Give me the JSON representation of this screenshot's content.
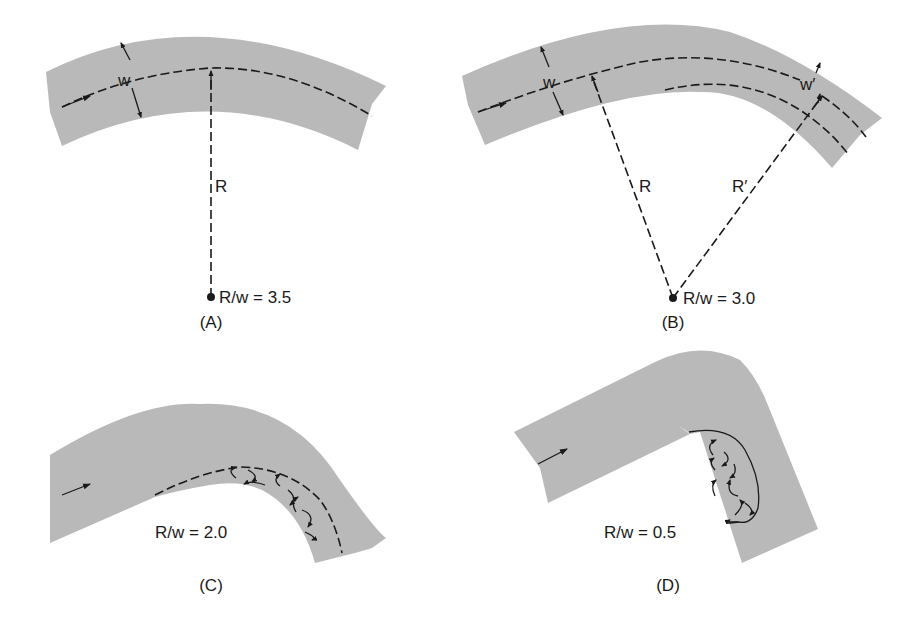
{
  "figure": {
    "panels": [
      {
        "id": "A",
        "caption": "(A)",
        "ratio_label": "R/w = 3.5",
        "radius_label": "R",
        "width_label": "w",
        "description": "Gentle bend, flow follows center streamline"
      },
      {
        "id": "B",
        "caption": "(B)",
        "ratio_label": "R/w = 3.0",
        "radius_label": "R",
        "radius_prime_label": "R′",
        "width_label": "w",
        "width_prime_label": "w′",
        "description": "Bend with reduced effective width w′ and radius R′"
      },
      {
        "id": "C",
        "caption": "(C)",
        "ratio_label": "R/w = 2.0",
        "description": "Sharper bend with eddies along inner bank"
      },
      {
        "id": "D",
        "caption": "(D)",
        "ratio_label": "R/w = 0.5",
        "description": "Very sharp bend with large separation zone of eddies"
      }
    ],
    "colors": {
      "channel_fill": "#b9b9b9",
      "ink": "#1a1a1a",
      "background": "#ffffff"
    }
  }
}
